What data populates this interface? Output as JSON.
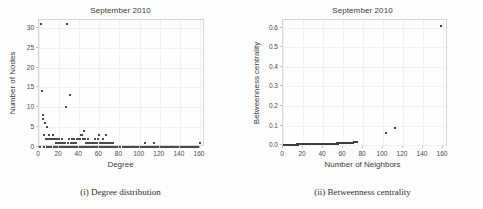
{
  "figure": {
    "panels": [
      {
        "id": "degree-distribution",
        "title": "September 2010",
        "caption": "(i) Degree distribution"
      },
      {
        "id": "betweenness-centrality",
        "title": "September 2010",
        "caption": "(ii) Betweenness centrality"
      }
    ]
  },
  "chart_data": [
    {
      "type": "scatter",
      "title": "September 2010",
      "caption": "(i) Degree distribution",
      "xlabel": "Degree",
      "ylabel": "Number of Nodes",
      "xlim": [
        0,
        165
      ],
      "ylim": [
        0,
        32
      ],
      "xticks": [
        0,
        20,
        40,
        60,
        80,
        100,
        120,
        140,
        160
      ],
      "xticklabels": [
        "0",
        "20",
        "40",
        "60",
        "80",
        "100",
        "120",
        "140",
        "160"
      ],
      "yticks": [
        0,
        5,
        10,
        15,
        20,
        25,
        30
      ],
      "yticklabels": [
        "0",
        "5",
        "10",
        "15",
        "20",
        "25",
        "30"
      ],
      "grid": true,
      "legend": "none",
      "marker_color": "#4a4a4a",
      "points": [
        [
          2,
          31
        ],
        [
          28,
          31
        ],
        [
          3,
          14
        ],
        [
          4,
          8
        ],
        [
          4,
          7
        ],
        [
          6,
          6
        ],
        [
          8,
          5
        ],
        [
          27,
          10
        ],
        [
          31,
          13
        ],
        [
          5,
          3
        ],
        [
          7,
          2
        ],
        [
          9,
          2
        ],
        [
          10,
          3
        ],
        [
          11,
          2
        ],
        [
          12,
          2
        ],
        [
          13,
          2
        ],
        [
          14,
          3
        ],
        [
          15,
          2
        ],
        [
          16,
          2
        ],
        [
          17,
          1
        ],
        [
          18,
          2
        ],
        [
          19,
          1
        ],
        [
          20,
          2
        ],
        [
          21,
          1
        ],
        [
          22,
          1
        ],
        [
          23,
          2
        ],
        [
          24,
          1
        ],
        [
          25,
          1
        ],
        [
          26,
          1
        ],
        [
          29,
          1
        ],
        [
          30,
          2
        ],
        [
          32,
          1
        ],
        [
          33,
          2
        ],
        [
          34,
          1
        ],
        [
          35,
          2
        ],
        [
          36,
          1
        ],
        [
          37,
          1
        ],
        [
          38,
          2
        ],
        [
          39,
          2
        ],
        [
          40,
          2
        ],
        [
          41,
          2
        ],
        [
          42,
          3
        ],
        [
          43,
          3
        ],
        [
          44,
          2
        ],
        [
          45,
          4
        ],
        [
          46,
          2
        ],
        [
          47,
          1
        ],
        [
          48,
          1
        ],
        [
          49,
          2
        ],
        [
          50,
          1
        ],
        [
          51,
          1
        ],
        [
          52,
          1
        ],
        [
          53,
          1
        ],
        [
          54,
          1
        ],
        [
          55,
          1
        ],
        [
          56,
          2
        ],
        [
          57,
          1
        ],
        [
          58,
          1
        ],
        [
          59,
          2
        ],
        [
          60,
          3
        ],
        [
          61,
          1
        ],
        [
          62,
          1
        ],
        [
          63,
          1
        ],
        [
          64,
          2
        ],
        [
          65,
          1
        ],
        [
          66,
          1
        ],
        [
          67,
          3
        ],
        [
          68,
          1
        ],
        [
          69,
          1
        ],
        [
          70,
          1
        ],
        [
          71,
          1
        ],
        [
          72,
          1
        ],
        [
          73,
          1
        ],
        [
          74,
          1
        ],
        [
          105,
          1
        ],
        [
          114,
          1
        ],
        [
          1,
          0
        ],
        [
          5,
          0
        ],
        [
          8,
          0
        ],
        [
          10,
          0
        ],
        [
          12,
          0
        ],
        [
          15,
          0
        ],
        [
          17,
          0
        ],
        [
          19,
          0
        ],
        [
          21,
          0
        ],
        [
          23,
          0
        ],
        [
          25,
          0
        ],
        [
          27,
          0
        ],
        [
          29,
          0
        ],
        [
          31,
          0
        ],
        [
          33,
          0
        ],
        [
          35,
          0
        ],
        [
          37,
          0
        ],
        [
          39,
          0
        ],
        [
          41,
          0
        ],
        [
          43,
          0
        ],
        [
          45,
          0
        ],
        [
          47,
          0
        ],
        [
          49,
          0
        ],
        [
          51,
          0
        ],
        [
          53,
          0
        ],
        [
          55,
          0
        ],
        [
          57,
          0
        ],
        [
          59,
          0
        ],
        [
          61,
          0
        ],
        [
          63,
          0
        ],
        [
          65,
          0
        ],
        [
          67,
          0
        ],
        [
          69,
          0
        ],
        [
          71,
          0
        ],
        [
          73,
          0
        ],
        [
          75,
          0
        ],
        [
          77,
          0
        ],
        [
          79,
          0
        ],
        [
          81,
          0
        ],
        [
          83,
          0
        ],
        [
          85,
          0
        ],
        [
          87,
          0
        ],
        [
          89,
          0
        ],
        [
          91,
          0
        ],
        [
          93,
          0
        ],
        [
          95,
          0
        ],
        [
          97,
          0
        ],
        [
          99,
          0
        ],
        [
          101,
          0
        ],
        [
          103,
          0
        ],
        [
          105,
          0
        ],
        [
          107,
          0
        ],
        [
          109,
          0
        ],
        [
          111,
          0
        ],
        [
          113,
          0
        ],
        [
          115,
          0
        ],
        [
          117,
          0
        ],
        [
          119,
          0
        ],
        [
          121,
          0
        ],
        [
          123,
          0
        ],
        [
          125,
          0
        ],
        [
          127,
          0
        ],
        [
          129,
          0
        ],
        [
          131,
          0
        ],
        [
          133,
          0
        ],
        [
          135,
          0
        ],
        [
          137,
          0
        ],
        [
          139,
          0
        ],
        [
          141,
          0
        ],
        [
          143,
          0
        ],
        [
          145,
          0
        ],
        [
          147,
          0
        ],
        [
          149,
          0
        ],
        [
          151,
          0
        ],
        [
          153,
          0
        ],
        [
          155,
          0
        ],
        [
          157,
          0
        ],
        [
          159,
          0
        ],
        [
          160,
          1
        ]
      ]
    },
    {
      "type": "scatter",
      "title": "September 2010",
      "caption": "(ii) Betweenness centrality",
      "xlabel": "Number of Neighbors",
      "ylabel": "Betweenness centrality",
      "xlim": [
        0,
        165
      ],
      "ylim": [
        -0.01,
        0.64
      ],
      "xticks": [
        0,
        20,
        40,
        60,
        80,
        100,
        120,
        140,
        160
      ],
      "xticklabels": [
        "0",
        "20",
        "40",
        "60",
        "80",
        "100",
        "120",
        "140",
        "160"
      ],
      "yticks": [
        0.0,
        0.1,
        0.2,
        0.3,
        0.4,
        0.5,
        0.6
      ],
      "yticklabels": [
        "0.0",
        "0.1",
        "0.2",
        "0.3",
        "0.4",
        "0.5",
        "0.6"
      ],
      "grid": true,
      "legend": "none",
      "marker_color": "#3d3d3d",
      "points": [
        [
          1,
          0.0
        ],
        [
          2,
          0.0
        ],
        [
          3,
          0.0
        ],
        [
          4,
          0.001
        ],
        [
          5,
          0.001
        ],
        [
          6,
          0.001
        ],
        [
          7,
          0.001
        ],
        [
          8,
          0.002
        ],
        [
          9,
          0.001
        ],
        [
          10,
          0.002
        ],
        [
          11,
          0.002
        ],
        [
          12,
          0.002
        ],
        [
          13,
          0.002
        ],
        [
          14,
          0.003
        ],
        [
          15,
          0.002
        ],
        [
          16,
          0.003
        ],
        [
          17,
          0.003
        ],
        [
          18,
          0.003
        ],
        [
          19,
          0.003
        ],
        [
          20,
          0.004
        ],
        [
          21,
          0.003
        ],
        [
          22,
          0.004
        ],
        [
          23,
          0.004
        ],
        [
          24,
          0.005
        ],
        [
          25,
          0.004
        ],
        [
          26,
          0.005
        ],
        [
          27,
          0.006
        ],
        [
          28,
          0.005
        ],
        [
          29,
          0.006
        ],
        [
          30,
          0.007
        ],
        [
          31,
          0.006
        ],
        [
          32,
          0.005
        ],
        [
          33,
          0.005
        ],
        [
          34,
          0.004
        ],
        [
          35,
          0.004
        ],
        [
          36,
          0.005
        ],
        [
          37,
          0.004
        ],
        [
          38,
          0.005
        ],
        [
          39,
          0.005
        ],
        [
          40,
          0.005
        ],
        [
          41,
          0.006
        ],
        [
          42,
          0.005
        ],
        [
          43,
          0.006
        ],
        [
          44,
          0.006
        ],
        [
          45,
          0.006
        ],
        [
          46,
          0.006
        ],
        [
          47,
          0.007
        ],
        [
          48,
          0.006
        ],
        [
          49,
          0.007
        ],
        [
          50,
          0.007
        ],
        [
          51,
          0.007
        ],
        [
          52,
          0.006
        ],
        [
          53,
          0.007
        ],
        [
          54,
          0.008
        ],
        [
          55,
          0.007
        ],
        [
          56,
          0.008
        ],
        [
          57,
          0.008
        ],
        [
          58,
          0.009
        ],
        [
          59,
          0.008
        ],
        [
          60,
          0.009
        ],
        [
          61,
          0.01
        ],
        [
          62,
          0.009
        ],
        [
          63,
          0.01
        ],
        [
          64,
          0.011
        ],
        [
          65,
          0.01
        ],
        [
          66,
          0.011
        ],
        [
          67,
          0.012
        ],
        [
          68,
          0.012
        ],
        [
          69,
          0.013
        ],
        [
          70,
          0.013
        ],
        [
          71,
          0.014
        ],
        [
          72,
          0.014
        ],
        [
          73,
          0.015
        ],
        [
          74,
          0.015
        ],
        [
          103,
          0.06
        ],
        [
          112,
          0.085
        ],
        [
          158,
          0.61
        ]
      ]
    }
  ]
}
